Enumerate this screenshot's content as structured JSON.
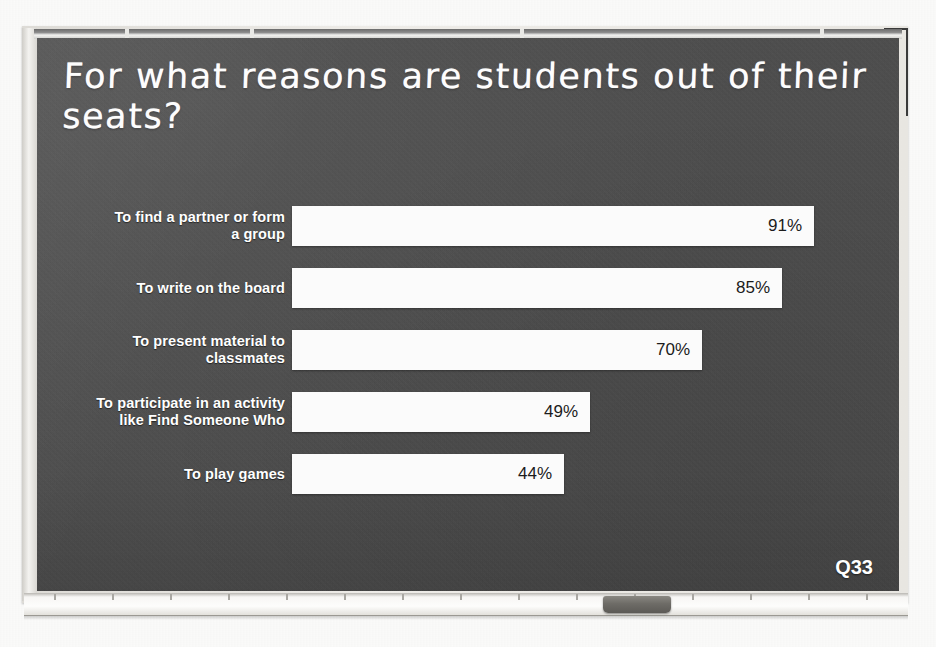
{
  "slide": {
    "title": "For what reasons are students out of their seats?",
    "question_tag": "Q33",
    "board_color": "#4b4b4b",
    "bar_color": "#fbfbfb",
    "text_color": "#ffffff"
  },
  "chart_data": {
    "type": "bar",
    "orientation": "horizontal",
    "title": "For what reasons are students out of their seats?",
    "xlabel": "",
    "ylabel": "",
    "xlim": [
      0,
      100
    ],
    "grid": false,
    "legend": null,
    "categories": [
      "To find a partner or form a group",
      "To write on the board",
      "To present material to classmates",
      "To participate in an activity like Find Someone Who",
      "To play games"
    ],
    "values": [
      91,
      85,
      70,
      49,
      44
    ],
    "value_labels": [
      "91%",
      "85%",
      "70%",
      "49%",
      "44%"
    ],
    "bars": [
      {
        "label_line1": "To find a partner or form",
        "label_line2": "a group",
        "value": 91,
        "value_label": "91%",
        "width_px": 522
      },
      {
        "label_line1": "To write on the board",
        "label_line2": "",
        "value": 85,
        "value_label": "85%",
        "width_px": 490
      },
      {
        "label_line1": "To present material to",
        "label_line2": "classmates",
        "value": 70,
        "value_label": "70%",
        "width_px": 410
      },
      {
        "label_line1": "To participate in an activity",
        "label_line2": "like Find Someone Who",
        "value": 49,
        "value_label": "49%",
        "width_px": 298
      },
      {
        "label_line1": "To play games",
        "label_line2": "",
        "value": 44,
        "value_label": "44%",
        "width_px": 272
      }
    ]
  },
  "frame": {
    "rail_clip_positions": [
      125,
      250,
      520,
      820
    ],
    "tray_notch_positions": [
      30,
      88,
      146,
      204,
      262,
      320,
      378,
      436,
      494,
      552,
      610,
      668,
      726,
      784,
      842
    ],
    "eraser_name": "whiteboard-eraser"
  }
}
